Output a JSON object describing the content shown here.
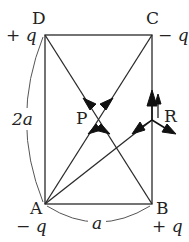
{
  "figure": {
    "type": "electrostatics-rectangle",
    "vertices": {
      "D": {
        "label": "D",
        "charge": "+ q"
      },
      "C": {
        "label": "C",
        "charge": "− q"
      },
      "A": {
        "label": "A",
        "charge": "− q"
      },
      "B": {
        "label": "B",
        "charge": "+ q"
      }
    },
    "points": {
      "P": {
        "label": "P"
      },
      "R": {
        "label": "R"
      }
    },
    "dimensions": {
      "height": "2a",
      "width": "a"
    }
  }
}
